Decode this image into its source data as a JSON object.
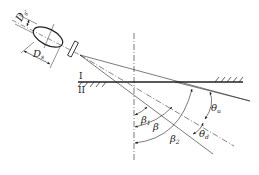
{
  "diagram": {
    "title": "",
    "colors": {
      "stroke": "#222222",
      "background": "#ffffff"
    },
    "media": [
      {
        "id": "I",
        "label": "I",
        "position": "upper medium"
      },
      {
        "id": "II",
        "label": "II",
        "position": "lower medium"
      }
    ],
    "transducer": {
      "dimension_labels": [
        {
          "main": "D",
          "sub": "s'",
          "meaning": "short dimension"
        },
        {
          "main": "D",
          "sub": "s",
          "meaning": "long dimension"
        }
      ]
    },
    "angles": [
      {
        "main": "β",
        "sub": "1",
        "meaning": "lower beam edge refraction angle"
      },
      {
        "main": "β",
        "sub": "",
        "meaning": "central beam refraction angle"
      },
      {
        "main": "β",
        "sub": "2",
        "meaning": "upper beam edge refraction angle"
      },
      {
        "main": "θ",
        "sub": "u",
        "meaning": "upper half beam spread"
      },
      {
        "main": "θ",
        "sub": "d",
        "meaning": "lower half beam spread"
      }
    ],
    "lines": [
      {
        "name": "normal-line",
        "style": "dash-dot"
      },
      {
        "name": "interface-line",
        "style": "solid"
      },
      {
        "name": "beam-upper-edge",
        "style": "solid"
      },
      {
        "name": "beam-center-axis",
        "style": "dash-dot"
      },
      {
        "name": "beam-lower-edge",
        "style": "solid"
      }
    ]
  }
}
